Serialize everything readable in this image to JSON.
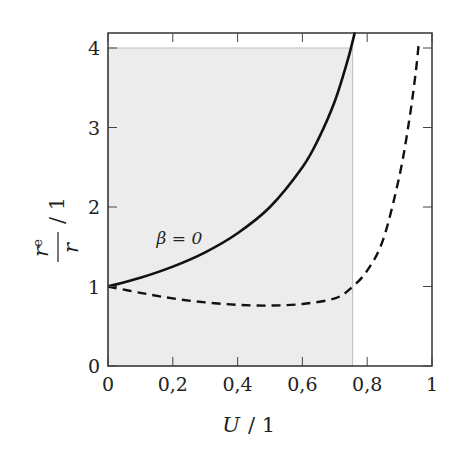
{
  "chart_data": {
    "type": "line",
    "title": "",
    "xlabel": "U / 1",
    "ylabel": "r_e / r / 1",
    "ylabel_parts": {
      "numerator": "r",
      "numerator_sub": "e",
      "denominator": "r",
      "unit": "/ 1"
    },
    "xlabel_parts": {
      "var": "U",
      "unit": "/ 1"
    },
    "xlim": [
      0,
      1
    ],
    "ylim": [
      0,
      4.2
    ],
    "x_ticks": [
      0,
      0.2,
      0.4,
      0.6,
      0.8,
      1
    ],
    "x_tick_labels": [
      "0",
      "0,2",
      "0,4",
      "0,6",
      "0,8",
      "1"
    ],
    "y_ticks": [
      0,
      1,
      2,
      3,
      4
    ],
    "y_tick_labels": [
      "0",
      "1",
      "2",
      "3",
      "4"
    ],
    "grid": false,
    "legend": null,
    "shaded_region": {
      "x": [
        0,
        0.755
      ],
      "y": [
        0,
        4
      ],
      "color": "#ececec"
    },
    "annotations": [
      {
        "text": "β = 0",
        "x": 0.15,
        "y": 1.6
      }
    ],
    "series": [
      {
        "name": "β = 0",
        "style": "solid",
        "color": "#111111",
        "x": [
          0,
          0.1,
          0.2,
          0.3,
          0.4,
          0.5,
          0.6,
          0.65,
          0.7,
          0.74,
          0.762
        ],
        "y": [
          1.0,
          1.11,
          1.25,
          1.43,
          1.67,
          2.0,
          2.5,
          2.86,
          3.33,
          3.85,
          4.2
        ]
      },
      {
        "name": "dashed",
        "style": "dashed",
        "color": "#111111",
        "x": [
          0,
          0.1,
          0.2,
          0.3,
          0.4,
          0.5,
          0.6,
          0.7,
          0.75,
          0.8,
          0.85,
          0.9,
          0.93,
          0.95,
          0.96
        ],
        "y": [
          1.0,
          0.92,
          0.85,
          0.8,
          0.77,
          0.76,
          0.78,
          0.85,
          0.98,
          1.2,
          1.6,
          2.4,
          3.1,
          3.7,
          4.1
        ]
      }
    ]
  }
}
